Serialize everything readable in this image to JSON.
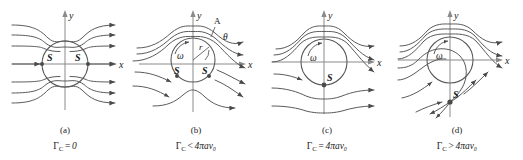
{
  "figure": {
    "name": "flow-past-rotating-cylinder-streamlines",
    "background_color": "#ffffff",
    "line_color": "#555555",
    "axis_color": "#7a7a7a",
    "text_color": "#1a1a1a",
    "panel_count": 4
  },
  "panels": [
    {
      "id": "a",
      "letter": "(a)",
      "formula": {
        "symbol": "Γ",
        "subscript": "C",
        "operator": "=",
        "rhs": "0"
      },
      "formula_plain": "ΓC = 0",
      "axes": {
        "x_label": "x",
        "y_label": "y"
      },
      "stagnation_points": [
        {
          "label": "S",
          "position": "left-of-circle-on-x-axis"
        },
        {
          "label": "S",
          "position": "right-of-circle-on-x-axis"
        }
      ],
      "omega_label": null,
      "extra_labels": []
    },
    {
      "id": "b",
      "letter": "(b)",
      "formula": {
        "symbol": "Γ",
        "subscript": "C",
        "operator": "<",
        "rhs": "4πav₀"
      },
      "formula_plain": "ΓC < 4πav0",
      "axes": {
        "x_label": "x",
        "y_label": "y"
      },
      "stagnation_points": [
        {
          "label": "S",
          "position": "lower-left-on-circle"
        },
        {
          "label": "S",
          "position": "lower-right-on-circle"
        }
      ],
      "omega_label": "ω",
      "extra_labels": [
        {
          "name": "point-A-label",
          "text": "A"
        },
        {
          "name": "angle-theta-label",
          "text": "θ"
        },
        {
          "name": "radius-r-label",
          "text": "r"
        }
      ]
    },
    {
      "id": "c",
      "letter": "(c)",
      "formula": {
        "symbol": "Γ",
        "subscript": "C",
        "operator": "=",
        "rhs": "4πav₀"
      },
      "formula_plain": "ΓC = 4πav0",
      "axes": {
        "x_label": "x",
        "y_label": "y"
      },
      "stagnation_points": [
        {
          "label": "S",
          "position": "bottom-of-circle"
        }
      ],
      "omega_label": "ω",
      "extra_labels": []
    },
    {
      "id": "d",
      "letter": "(d)",
      "formula": {
        "symbol": "Γ",
        "subscript": "C",
        "operator": ">",
        "rhs": "4πav₀"
      },
      "formula_plain": "ΓC > 4πav0",
      "axes": {
        "x_label": "x",
        "y_label": "y"
      },
      "stagnation_points": [
        {
          "label": "S",
          "position": "below-circle-outside"
        }
      ],
      "omega_label": "ω",
      "extra_labels": []
    }
  ]
}
